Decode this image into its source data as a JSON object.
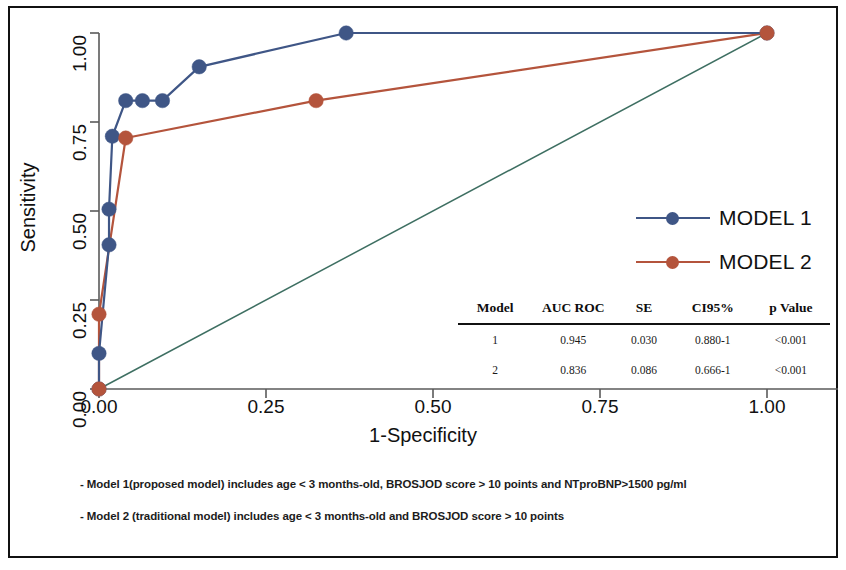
{
  "chart_data": {
    "type": "line",
    "title": "",
    "xlabel": "1-Specificity",
    "ylabel": "Sensitivity",
    "xlim": [
      0,
      1
    ],
    "ylim": [
      0,
      1
    ],
    "grid": false,
    "legend_position": "right",
    "x_ticks": [
      "0.00",
      "0.25",
      "0.50",
      "0.75",
      "1.00"
    ],
    "y_ticks": [
      "0.00",
      "0.25",
      "0.50",
      "0.75",
      "1.00"
    ],
    "x_tick_values": [
      0,
      0.25,
      0.5,
      0.75,
      1
    ],
    "y_tick_values": [
      0,
      0.25,
      0.5,
      0.75,
      1
    ],
    "series": [
      {
        "name": "MODEL 1",
        "color": "#3f5686",
        "marker": "circle",
        "points": [
          {
            "x": 0.0,
            "y": 0.0
          },
          {
            "x": 0.0,
            "y": 0.1
          },
          {
            "x": 0.015,
            "y": 0.405
          },
          {
            "x": 0.015,
            "y": 0.505
          },
          {
            "x": 0.02,
            "y": 0.71
          },
          {
            "x": 0.04,
            "y": 0.81
          },
          {
            "x": 0.065,
            "y": 0.81
          },
          {
            "x": 0.095,
            "y": 0.81
          },
          {
            "x": 0.15,
            "y": 0.905
          },
          {
            "x": 0.37,
            "y": 1.0
          },
          {
            "x": 1.0,
            "y": 1.0
          }
        ]
      },
      {
        "name": "MODEL 2",
        "color": "#b4543c",
        "marker": "circle",
        "points": [
          {
            "x": 0.0,
            "y": 0.0
          },
          {
            "x": 0.0,
            "y": 0.21
          },
          {
            "x": 0.04,
            "y": 0.705
          },
          {
            "x": 0.325,
            "y": 0.81
          },
          {
            "x": 1.0,
            "y": 1.0
          }
        ]
      },
      {
        "name": "reference-diagonal",
        "color": "#3e6f62",
        "marker": "none",
        "points": [
          {
            "x": 0.0,
            "y": 0.0
          },
          {
            "x": 1.0,
            "y": 1.0
          }
        ]
      }
    ]
  },
  "axes": {
    "x_title": "1-Specificity",
    "y_title": "Sensitivity"
  },
  "legend": {
    "items": [
      {
        "label": "MODEL 1",
        "color": "#3f5686"
      },
      {
        "label": "MODEL 2",
        "color": "#b4543c"
      }
    ]
  },
  "stats_table": {
    "headers": [
      "Model",
      "AUC ROC",
      "SE",
      "CI95%",
      "p Value"
    ],
    "rows": [
      [
        "1",
        "0.945",
        "0.030",
        "0.880-1",
        "<0.001"
      ],
      [
        "2",
        "0.836",
        "0.086",
        "0.666-1",
        "<0.001"
      ]
    ]
  },
  "footnotes": [
    "- Model 1(proposed model) includes age < 3 months-old, BROSJOD score > 10 points and NTproBNP>1500 pg/ml",
    "- Model 2 (traditional model) includes age < 3 months-old and BROSJOD score > 10 points"
  ]
}
